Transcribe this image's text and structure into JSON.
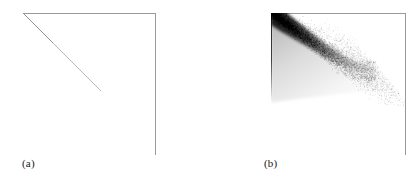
{
  "figure": {
    "background": "#ffffff",
    "axis_color": "#9a9a9a",
    "ink_color": "#1a1a1a"
  },
  "panels": [
    {
      "id": "a",
      "caption": "(a)",
      "frame": {
        "type": "L-shape",
        "top_rule": true,
        "right_rule": true
      },
      "content": {
        "kind": "single-line",
        "description": "thin grey straight line descending from upper-left corner",
        "line_color": "#b0b0b0"
      }
    },
    {
      "id": "b",
      "caption": "(b)",
      "frame": {
        "type": "L-shape",
        "top_rule": true,
        "right_rule": true
      },
      "content": {
        "kind": "scatter-density",
        "description": "dense greyscale point cloud forming a dark diagonal band from upper-left, fanning out and fading toward lower-right",
        "point_color": "#000000"
      }
    }
  ],
  "chart_data": [
    {
      "type": "line",
      "panel": "a",
      "title": "(a)",
      "xlabel": "",
      "ylabel": "",
      "grid": false,
      "legend": null,
      "axes_style": "top and right spines only",
      "xlim": [
        0,
        1
      ],
      "ylim": [
        0,
        1
      ],
      "series": [
        {
          "name": "diagonal",
          "x": [
            0.0,
            0.1,
            0.2,
            0.3,
            0.4,
            0.5,
            0.6
          ],
          "y": [
            1.0,
            0.908,
            0.815,
            0.723,
            0.631,
            0.538,
            0.446
          ]
        }
      ]
    },
    {
      "type": "scatter",
      "panel": "b",
      "title": "(b)",
      "xlabel": "",
      "ylabel": "",
      "grid": false,
      "legend": null,
      "axes_style": "top and right spines only",
      "xlim": [
        0,
        1
      ],
      "ylim": [
        0,
        1
      ],
      "density": "high near upper-left diagonal, decaying toward lower-right",
      "series": [
        {
          "name": "cloud",
          "x": [
            0.0,
            0.03,
            0.06,
            0.09,
            0.12,
            0.15,
            0.18,
            0.22,
            0.26,
            0.3,
            0.35,
            0.4,
            0.45,
            0.5,
            0.55,
            0.6,
            0.65,
            0.7,
            0.75,
            0.8
          ],
          "y": [
            1.0,
            0.97,
            0.94,
            0.91,
            0.88,
            0.85,
            0.82,
            0.78,
            0.74,
            0.7,
            0.65,
            0.6,
            0.56,
            0.52,
            0.48,
            0.45,
            0.42,
            0.4,
            0.38,
            0.36
          ],
          "weight": [
            1.0,
            0.98,
            0.95,
            0.92,
            0.88,
            0.83,
            0.78,
            0.72,
            0.66,
            0.6,
            0.52,
            0.45,
            0.38,
            0.31,
            0.25,
            0.2,
            0.15,
            0.11,
            0.08,
            0.05
          ]
        }
      ]
    }
  ]
}
